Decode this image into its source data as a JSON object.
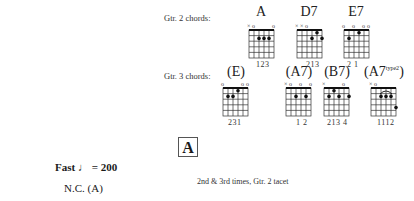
{
  "gtr2": {
    "label": "Gtr. 2 chords:",
    "chords": [
      {
        "name": "A",
        "fingers": "123",
        "marks": "xo    o"
      },
      {
        "name": "D7",
        "fingers": "213",
        "marks": "xxo"
      },
      {
        "name": "E7",
        "fingers": "2 1",
        "marks": "o  o  oo"
      }
    ]
  },
  "gtr3": {
    "label": "Gtr. 3 chords:",
    "chords": [
      {
        "name": "(E)",
        "fingers": "231",
        "marks": "o    oo"
      },
      {
        "name": "(A7)",
        "fingers": "1 2",
        "marks": "xo  o  o"
      },
      {
        "name": "(B7)",
        "fingers": "213 4",
        "marks": "x    o"
      },
      {
        "name": "(A7",
        "sup": "type2",
        "close": ")",
        "fingers": "1112",
        "marks": "xo"
      }
    ]
  },
  "section": {
    "label": "A"
  },
  "tempo": {
    "text": "Fast",
    "note": "♩",
    "value": "= 200"
  },
  "nc": {
    "text": "N.C. (A)"
  },
  "instruction": {
    "text": "2nd & 3rd times, Gtr. 2 tacet"
  }
}
